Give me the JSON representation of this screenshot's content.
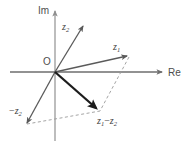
{
  "figure": {
    "background_color": "#ffffff",
    "width": 191,
    "height": 147
  },
  "axes": {
    "real": {
      "label": "Re",
      "name": "real-axis",
      "orientation": "horizontal",
      "color": "#6e6e6e",
      "from": [
        10,
        72
      ],
      "to": [
        163,
        72
      ],
      "arrow": true
    },
    "imaginary": {
      "label": "Im",
      "name": "imaginary-axis",
      "orientation": "vertical",
      "color": "#9a9a9a",
      "from": [
        55,
        140
      ],
      "to": [
        55,
        9
      ],
      "arrow": true
    },
    "origin": {
      "label": "O",
      "x": 55,
      "y": 72
    }
  },
  "vectors": [
    {
      "id": "z2",
      "label": "z",
      "subscript": "2",
      "operator": "",
      "color": "#5a5a5a",
      "width": 1.3,
      "from": [
        55,
        72
      ],
      "to": [
        84,
        25
      ],
      "label_pos": [
        62,
        26
      ],
      "description": "vector z2 pointing up and to the right at a steep angle"
    },
    {
      "id": "z1",
      "label": "z",
      "subscript": "1",
      "operator": "",
      "color": "#5a5a5a",
      "width": 1.3,
      "from": [
        55,
        72
      ],
      "to": [
        129,
        56
      ],
      "label_pos": [
        114,
        48
      ],
      "description": "vector z1 pointing up and to the right at a shallow angle"
    },
    {
      "id": "z1-minus-z2",
      "label": "z",
      "subscript": "1",
      "operator": "−",
      "label2": "z",
      "subscript2": "2",
      "color": "#1c1c1c",
      "width": 2.4,
      "from": [
        55,
        72
      ],
      "to": [
        97,
        109
      ],
      "label_pos": [
        97,
        122
      ],
      "description": "bold vector z1 minus z2 pointing down and to the right"
    },
    {
      "id": "minus-z2",
      "label": "z",
      "subscript": "2",
      "operator": "−",
      "color": "#5a5a5a",
      "width": 1.3,
      "from": [
        55,
        72
      ],
      "to": [
        26,
        124
      ],
      "label_pos": [
        10,
        110
      ],
      "description": "vector negative z2 pointing down and to the left"
    }
  ],
  "construction_lines": [
    {
      "id": "dashed-z1-to-diff",
      "name": "dashed-line-z1-to-difference",
      "from": [
        129,
        56
      ],
      "to": [
        99,
        110
      ],
      "color": "#9a9a9a",
      "dash": "3,2.5"
    },
    {
      "id": "dashed-minusz2-to-diff",
      "name": "dashed-line-minus-z2-to-difference",
      "from": [
        26,
        124
      ],
      "to": [
        99,
        110
      ],
      "color": "#9a9a9a",
      "dash": "3,2.5"
    }
  ],
  "labels": {
    "im": "Im",
    "re": "Re",
    "origin": "O",
    "minus_sign": "−"
  }
}
